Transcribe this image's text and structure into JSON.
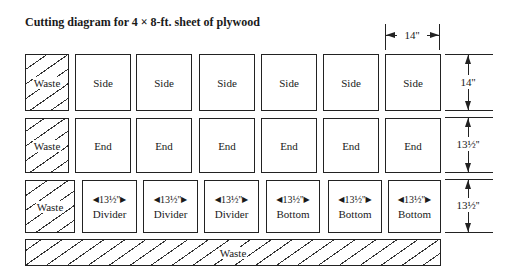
{
  "title": "Cutting diagram for 4 × 8-ft. sheet of plywood",
  "rows": [
    {
      "waste_label": "Waste",
      "pieces": [
        "Side",
        "Side",
        "Side",
        "Side",
        "Side",
        "Side"
      ],
      "height_dim": "14''"
    },
    {
      "waste_label": "Waste",
      "pieces": [
        "End",
        "End",
        "End",
        "End",
        "End",
        "End"
      ],
      "height_dim": "13½''"
    },
    {
      "waste_label": "Waste",
      "pieces": [
        "Divider",
        "Divider",
        "Divider",
        "Bottom",
        "Bottom",
        "Bottom"
      ],
      "piece_width_dim": "13½''",
      "height_dim": "13½''"
    }
  ],
  "top_width_dim": "14''",
  "bottom_waste_label": "Waste"
}
